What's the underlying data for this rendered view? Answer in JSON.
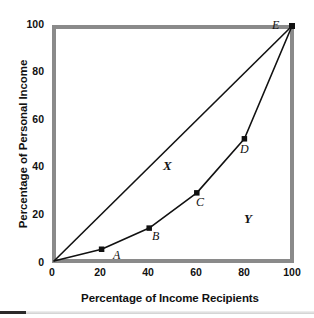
{
  "chart_data": {
    "type": "line",
    "title": "",
    "xlabel": "Percentage of Income Recipients",
    "ylabel": "Percentage of Personal Income",
    "xlim": [
      0,
      100
    ],
    "ylim": [
      0,
      100
    ],
    "xticks": [
      "0",
      "20",
      "40",
      "60",
      "80",
      "100"
    ],
    "yticks": [
      "0",
      "20",
      "40",
      "60",
      "80",
      "100"
    ],
    "xtick_values": [
      0,
      20,
      40,
      60,
      80,
      100
    ],
    "ytick_values": [
      0,
      20,
      40,
      60,
      80,
      100
    ],
    "grid": false,
    "legend": "none",
    "series": [
      {
        "name": "Line of equality",
        "x": [
          0,
          100
        ],
        "values": [
          0,
          100
        ],
        "style": "straight-line",
        "color": "#111111"
      },
      {
        "name": "Lorenz curve",
        "x": [
          0,
          20,
          40,
          60,
          80,
          100
        ],
        "values": [
          0,
          5,
          14,
          29,
          52,
          100
        ],
        "style": "line-with-markers",
        "color": "#111111"
      }
    ],
    "points": [
      {
        "label": "A",
        "x": 20,
        "y": 5
      },
      {
        "label": "B",
        "x": 40,
        "y": 14
      },
      {
        "label": "C",
        "x": 60,
        "y": 29
      },
      {
        "label": "D",
        "x": 80,
        "y": 52
      },
      {
        "label": "E",
        "x": 100,
        "y": 100
      }
    ],
    "annotations": [
      {
        "label": "X",
        "x": 48,
        "y": 60,
        "note": "area between line of equality and Lorenz curve"
      },
      {
        "label": "Y",
        "x": 82,
        "y": 18,
        "note": "area below Lorenz curve"
      }
    ],
    "colors": {
      "frame": "#8a8a8a",
      "curve": "#111111",
      "marker": "#111111",
      "text": "#111111",
      "background": "#ffffff"
    }
  },
  "axes": {
    "y_title": "Percentage of Personal Income",
    "x_title": "Percentage of Income Recipients",
    "y_ticks": [
      {
        "label": "100"
      },
      {
        "label": "80"
      },
      {
        "label": "60"
      },
      {
        "label": "40"
      },
      {
        "label": "20"
      },
      {
        "label": "0"
      }
    ],
    "x_ticks": [
      {
        "label": "0"
      },
      {
        "label": "20"
      },
      {
        "label": "40"
      },
      {
        "label": "60"
      },
      {
        "label": "80"
      },
      {
        "label": "100"
      }
    ]
  },
  "labels": {
    "point_a": "A",
    "point_b": "B",
    "point_c": "C",
    "point_d": "D",
    "point_e": "E",
    "region_x": "X",
    "region_y": "Y"
  }
}
